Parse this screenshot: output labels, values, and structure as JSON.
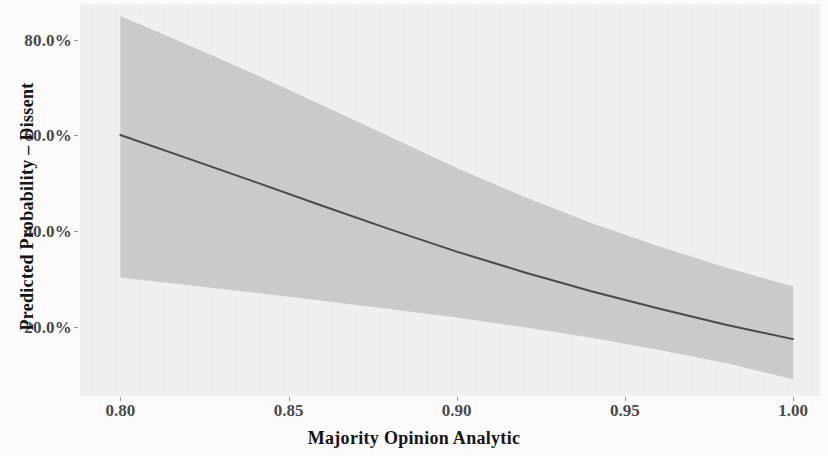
{
  "figure": {
    "background_color": "#fdfdfd",
    "panel_background_color": "#f2f2f2"
  },
  "axes": {
    "x_title": "Majority Opinion Analytic",
    "y_title": "Predicted Probability – Dissent"
  },
  "chart_data": {
    "type": "line",
    "title": "",
    "subtitle": "",
    "xlabel": "Majority Opinion Analytic",
    "ylabel": "Predicted Probability – Dissent",
    "xlim": [
      0.788,
      1.008
    ],
    "ylim": [
      0.055,
      0.875
    ],
    "grid": false,
    "legend": "none",
    "x_tick_labels": [
      "0.80",
      "0.85",
      "0.90",
      "0.95",
      "1.00"
    ],
    "x_tick_values": [
      0.8,
      0.85,
      0.9,
      0.95,
      1.0
    ],
    "y_tick_labels": [
      "20.0%",
      "40.0%",
      "60.0%",
      "80.0%"
    ],
    "y_tick_values": [
      0.2,
      0.4,
      0.6,
      0.8
    ],
    "line_color": "#4b4b52",
    "ribbon_color": "#c9c9c9",
    "x": [
      0.8,
      0.82,
      0.84,
      0.86,
      0.88,
      0.9,
      0.92,
      0.94,
      0.96,
      0.98,
      1.0
    ],
    "series": [
      {
        "name": "Predicted probability of dissent",
        "values": [
          0.601,
          0.552,
          0.503,
          0.453,
          0.404,
          0.357,
          0.314,
          0.274,
          0.238,
          0.204,
          0.174
        ]
      },
      {
        "name": "95% CI upper bound",
        "values": [
          0.85,
          0.79,
          0.728,
          0.663,
          0.598,
          0.532,
          0.472,
          0.417,
          0.368,
          0.324,
          0.284
        ]
      },
      {
        "name": "95% CI lower bound",
        "values": [
          0.303,
          0.287,
          0.271,
          0.254,
          0.237,
          0.219,
          0.199,
          0.177,
          0.152,
          0.124,
          0.09
        ]
      }
    ]
  }
}
